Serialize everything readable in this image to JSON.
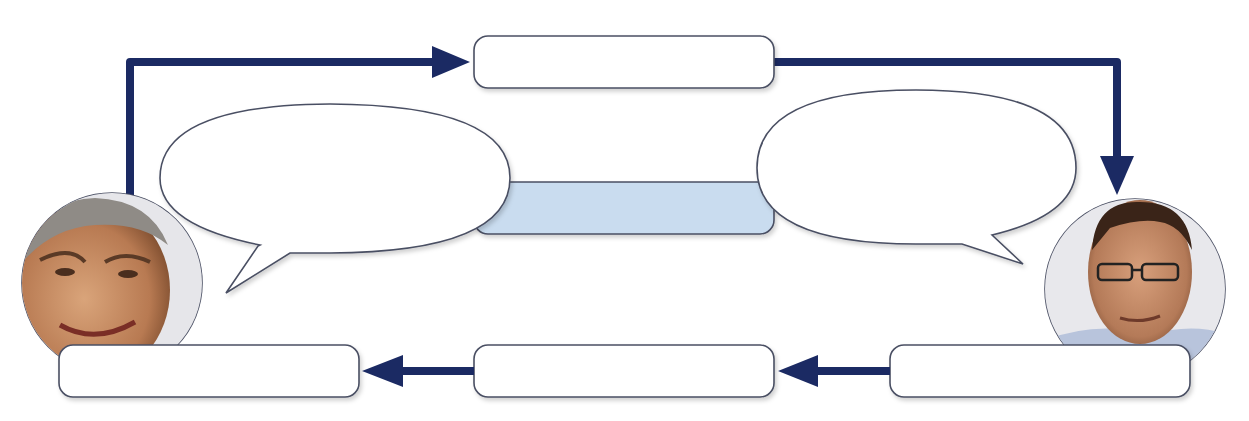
{
  "diagram": {
    "type": "communication-process",
    "colors": {
      "arrow": "#1b2a63",
      "box_border": "#4a4f63",
      "box_fill": "#ffffff",
      "channel_fill": "#c9dcef"
    },
    "boxes": {
      "top_center": {
        "label": "",
        "x": 474,
        "y": 36,
        "w": 300,
        "h": 52
      },
      "channel": {
        "label": "",
        "x": 474,
        "y": 182,
        "w": 300,
        "h": 52
      },
      "bottom_left": {
        "label": "",
        "x": 59,
        "y": 345,
        "w": 300,
        "h": 52
      },
      "bottom_center": {
        "label": "",
        "x": 474,
        "y": 345,
        "w": 300,
        "h": 52
      },
      "bottom_right": {
        "label": "",
        "x": 890,
        "y": 345,
        "w": 300,
        "h": 52
      }
    },
    "speech_bubbles": {
      "left": {
        "label": ""
      },
      "right": {
        "label": ""
      }
    },
    "people": {
      "left": {
        "description": "smiling grey-haired man",
        "role": "sender"
      },
      "right": {
        "description": "man with glasses",
        "role": "receiver"
      }
    },
    "arrows": [
      {
        "from": "left-person",
        "to": "top_center",
        "direction": "up-then-right"
      },
      {
        "from": "top_center",
        "to": "right-person",
        "direction": "right-then-down"
      },
      {
        "from": "bottom_right",
        "to": "bottom_center",
        "direction": "left"
      },
      {
        "from": "bottom_center",
        "to": "bottom_left",
        "direction": "left"
      }
    ]
  }
}
